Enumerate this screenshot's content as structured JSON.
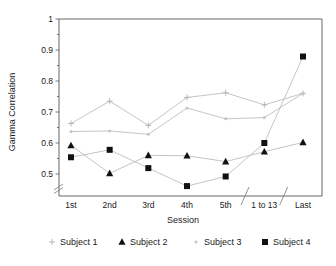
{
  "chart_data": {
    "type": "line",
    "title": "",
    "xlabel": "Session",
    "ylabel": "Gamma Correlation",
    "categories": [
      "1st",
      "2nd",
      "3rd",
      "4th",
      "5th",
      "1 to 13",
      "Last"
    ],
    "ylim": [
      0.455,
      1.0
    ],
    "yticks": [
      0.5,
      0.6,
      0.7,
      0.8,
      0.9,
      1
    ],
    "ytick_labels": [
      "0.5",
      "0.6",
      "0.7",
      "0.8",
      "0.9",
      "1"
    ],
    "grid": false,
    "legend_position": "bottom",
    "axis_breaks": {
      "y_axis_break": true,
      "x_axis_breaks": [
        "after 5th",
        "after 1 to 13"
      ]
    },
    "series": [
      {
        "name": "Subject 1",
        "marker": "plus",
        "marker_color": "#b0b0b0",
        "line_color": "#b9b9b9",
        "values": [
          0.663,
          0.735,
          0.657,
          0.747,
          0.762,
          0.723,
          0.76
        ]
      },
      {
        "name": "Subject 2",
        "marker": "triangle",
        "marker_color": "#111111",
        "line_color": "#9a9a9a",
        "values": [
          0.592,
          0.502,
          0.56,
          0.559,
          0.54,
          0.572,
          0.602
        ]
      },
      {
        "name": "Subject 3",
        "marker": "dot",
        "marker_color": "#c4c4c4",
        "line_color": "#c8c8c8",
        "values": [
          0.637,
          0.639,
          0.628,
          0.713,
          0.678,
          0.682,
          0.76
        ]
      },
      {
        "name": "Subject 4",
        "marker": "square",
        "marker_color": "#111111",
        "line_color": "#9a9a9a",
        "values": [
          0.554,
          0.578,
          0.519,
          0.461,
          0.492,
          0.6,
          0.879
        ]
      }
    ]
  },
  "legend": {
    "items": [
      {
        "label": "Subject 1",
        "marker": "plus-marker-icon"
      },
      {
        "label": "Subject 2",
        "marker": "triangle-marker-icon"
      },
      {
        "label": "Subject 3",
        "marker": "dot-marker-icon"
      },
      {
        "label": "Subject 4",
        "marker": "square-marker-icon"
      }
    ]
  }
}
